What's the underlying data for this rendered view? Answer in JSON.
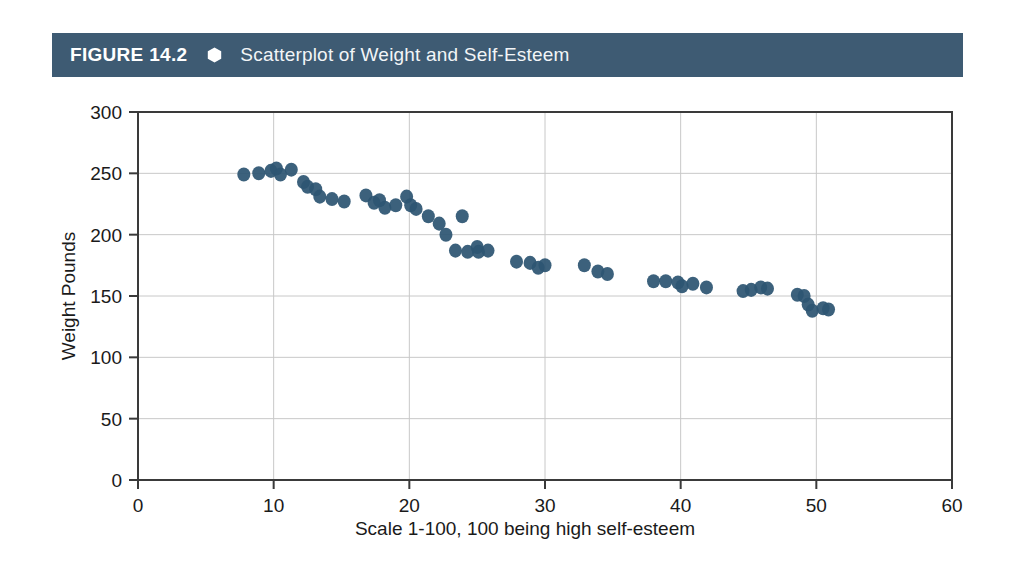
{
  "header": {
    "figure_number": "FIGURE 14.2",
    "bullet_icon": "hexagon-icon",
    "title": "Scatterplot of Weight and Self-Esteem",
    "bar_color": "#3e5b73",
    "text_color": "#ffffff"
  },
  "chart_data": {
    "type": "scatter",
    "title": "Scatterplot of Weight and Self-Esteem",
    "xlabel": "Scale 1-100, 100 being high self-esteem",
    "ylabel": "Weight Pounds",
    "xlim": [
      0,
      60
    ],
    "ylim": [
      0,
      300
    ],
    "xticks": [
      0,
      10,
      20,
      30,
      40,
      50,
      60
    ],
    "yticks": [
      0,
      50,
      100,
      150,
      200,
      250,
      300
    ],
    "grid": true,
    "legend": null,
    "marker_color": "#2d5572",
    "marker_size": 11,
    "points": [
      {
        "x": 7.8,
        "y": 249
      },
      {
        "x": 8.9,
        "y": 250
      },
      {
        "x": 9.8,
        "y": 252
      },
      {
        "x": 10.2,
        "y": 254
      },
      {
        "x": 10.5,
        "y": 249
      },
      {
        "x": 11.3,
        "y": 253
      },
      {
        "x": 12.2,
        "y": 243
      },
      {
        "x": 12.5,
        "y": 239
      },
      {
        "x": 13.1,
        "y": 237
      },
      {
        "x": 13.4,
        "y": 231
      },
      {
        "x": 14.3,
        "y": 229
      },
      {
        "x": 15.2,
        "y": 227
      },
      {
        "x": 16.8,
        "y": 232
      },
      {
        "x": 17.4,
        "y": 226
      },
      {
        "x": 17.8,
        "y": 228
      },
      {
        "x": 18.2,
        "y": 222
      },
      {
        "x": 19.0,
        "y": 224
      },
      {
        "x": 19.8,
        "y": 231
      },
      {
        "x": 20.1,
        "y": 224
      },
      {
        "x": 20.5,
        "y": 221
      },
      {
        "x": 21.4,
        "y": 215
      },
      {
        "x": 22.2,
        "y": 209
      },
      {
        "x": 22.7,
        "y": 200
      },
      {
        "x": 23.4,
        "y": 187
      },
      {
        "x": 23.9,
        "y": 215
      },
      {
        "x": 24.3,
        "y": 186
      },
      {
        "x": 25.0,
        "y": 190
      },
      {
        "x": 25.1,
        "y": 186
      },
      {
        "x": 25.8,
        "y": 187
      },
      {
        "x": 27.9,
        "y": 178
      },
      {
        "x": 28.9,
        "y": 177
      },
      {
        "x": 29.5,
        "y": 173
      },
      {
        "x": 30.0,
        "y": 175
      },
      {
        "x": 32.9,
        "y": 175
      },
      {
        "x": 33.9,
        "y": 170
      },
      {
        "x": 34.6,
        "y": 168
      },
      {
        "x": 38.0,
        "y": 162
      },
      {
        "x": 38.9,
        "y": 162
      },
      {
        "x": 39.8,
        "y": 161
      },
      {
        "x": 40.1,
        "y": 158
      },
      {
        "x": 40.9,
        "y": 160
      },
      {
        "x": 41.9,
        "y": 157
      },
      {
        "x": 44.6,
        "y": 154
      },
      {
        "x": 45.2,
        "y": 155
      },
      {
        "x": 45.9,
        "y": 157
      },
      {
        "x": 46.4,
        "y": 156
      },
      {
        "x": 48.6,
        "y": 151
      },
      {
        "x": 49.1,
        "y": 150
      },
      {
        "x": 49.4,
        "y": 143
      },
      {
        "x": 49.7,
        "y": 138
      },
      {
        "x": 50.5,
        "y": 140
      },
      {
        "x": 50.9,
        "y": 139
      }
    ]
  }
}
